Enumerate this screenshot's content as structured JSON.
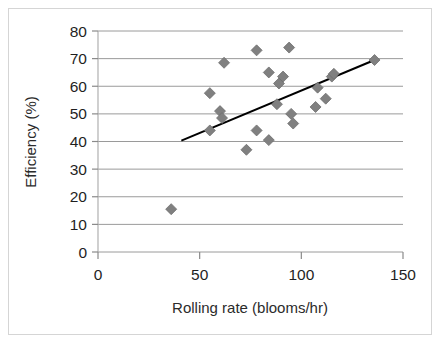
{
  "chart_data": {
    "type": "scatter",
    "title": "",
    "xlabel": "Rolling rate (blooms/hr)",
    "ylabel": "Efficiency (%)",
    "xlim": [
      0,
      150
    ],
    "ylim": [
      0,
      80
    ],
    "xticks": [
      0,
      50,
      100,
      150
    ],
    "yticks": [
      0,
      10,
      20,
      30,
      40,
      50,
      60,
      70,
      80
    ],
    "xtick_labels": [
      "0",
      "50",
      "100",
      "150"
    ],
    "ytick_labels": [
      "0",
      "10",
      "20",
      "30",
      "40",
      "50",
      "60",
      "70",
      "80"
    ],
    "grid": "horizontal",
    "legend": "none",
    "marker": {
      "shape": "diamond",
      "color": "#808080",
      "edge_color": "#6f6f6f",
      "size": 11
    },
    "series": [
      {
        "name": "Efficiency vs rolling rate",
        "points": [
          {
            "x": 36,
            "y": 15.5
          },
          {
            "x": 55,
            "y": 44.0
          },
          {
            "x": 55,
            "y": 57.5
          },
          {
            "x": 60,
            "y": 51.0
          },
          {
            "x": 61,
            "y": 48.5
          },
          {
            "x": 62,
            "y": 68.5
          },
          {
            "x": 73,
            "y": 37.0
          },
          {
            "x": 78,
            "y": 44.0
          },
          {
            "x": 78,
            "y": 73.0
          },
          {
            "x": 84,
            "y": 40.5
          },
          {
            "x": 84,
            "y": 65.0
          },
          {
            "x": 88,
            "y": 53.5
          },
          {
            "x": 89,
            "y": 61.0
          },
          {
            "x": 91,
            "y": 63.5
          },
          {
            "x": 94,
            "y": 74.0
          },
          {
            "x": 95,
            "y": 50.0
          },
          {
            "x": 96,
            "y": 46.5
          },
          {
            "x": 107,
            "y": 52.5
          },
          {
            "x": 108,
            "y": 59.5
          },
          {
            "x": 112,
            "y": 55.5
          },
          {
            "x": 115,
            "y": 63.5
          },
          {
            "x": 116,
            "y": 64.5
          },
          {
            "x": 136,
            "y": 69.5
          }
        ]
      }
    ],
    "trendline": {
      "type": "linear",
      "color": "#000000",
      "x_start": 41,
      "y_start": 40.3,
      "x_end": 136,
      "y_end": 69.5
    }
  }
}
